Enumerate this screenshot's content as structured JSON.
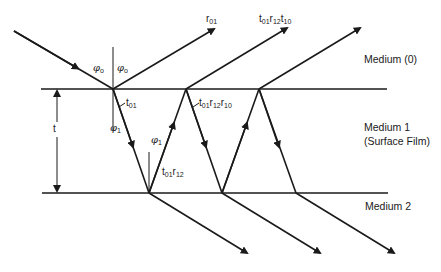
{
  "diagram": {
    "media": [
      {
        "id": "medium-0",
        "label": "Medium (0)"
      },
      {
        "id": "medium-1",
        "label": "Medium 1",
        "sublabel": "(Surface Film)"
      },
      {
        "id": "medium-2",
        "label": "Medium 2"
      }
    ],
    "thickness_label": "t",
    "angles": {
      "incident": {
        "symbol": "φ",
        "sub": "o"
      },
      "reflected": {
        "symbol": "φ",
        "sub": "o"
      },
      "refracted_1": {
        "symbol": "φ",
        "sub": "1"
      },
      "refracted_2": {
        "symbol": "φ",
        "sub": "1"
      }
    },
    "ray_labels": {
      "r01": {
        "base": "r",
        "sub": "01"
      },
      "t01": {
        "base": "t",
        "sub": "01"
      },
      "t01r12": [
        {
          "base": "t",
          "sub": "01"
        },
        {
          "base": "r",
          "sub": "12"
        }
      ],
      "t01r12r10": [
        {
          "base": "t",
          "sub": "01"
        },
        {
          "base": "r",
          "sub": "12"
        },
        {
          "base": "r",
          "sub": "10"
        }
      ],
      "t01r12t10": [
        {
          "base": "t",
          "sub": "01"
        },
        {
          "base": "r",
          "sub": "12"
        },
        {
          "base": "t",
          "sub": "10"
        }
      ]
    },
    "colors": {
      "line": "#1a1a1a",
      "background": "#ffffff"
    }
  }
}
